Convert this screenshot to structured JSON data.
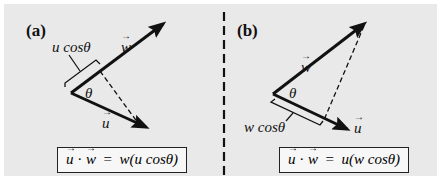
{
  "panels": {
    "a": {
      "tag": "(a)",
      "w_label": "w",
      "u_label": "u",
      "theta": "θ",
      "projection_label": "u cosθ",
      "equation": {
        "lhs_u": "u",
        "dot": "·",
        "lhs_w": "w",
        "eq": "=",
        "rhs": "w(u cosθ)"
      }
    },
    "b": {
      "tag": "(b)",
      "w_label": "w",
      "u_label": "u",
      "theta": "θ",
      "projection_label": "w cosθ",
      "equation": {
        "lhs_u": "u",
        "dot": "·",
        "lhs_w": "w",
        "eq": "=",
        "rhs": "u(w cosθ)"
      }
    }
  },
  "colors": {
    "background": "#e9e9e9",
    "ink": "#111111"
  }
}
